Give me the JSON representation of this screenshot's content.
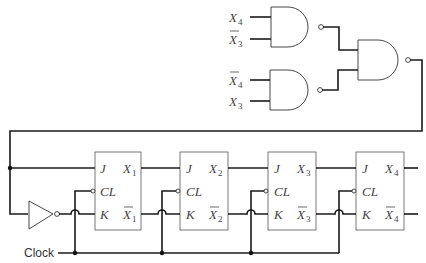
{
  "diagram": {
    "type": "logic-circuit",
    "gates": {
      "nand_top": {
        "inputs": [
          "X4",
          "X̄3"
        ],
        "input_labels": [
          {
            "base": "X",
            "sub": "4",
            "bar": false
          },
          {
            "base": "X",
            "sub": "3",
            "bar": true
          }
        ]
      },
      "nand_bottom": {
        "inputs": [
          "X̄4",
          "X3"
        ],
        "input_labels": [
          {
            "base": "X",
            "sub": "4",
            "bar": true
          },
          {
            "base": "X",
            "sub": "3",
            "bar": false
          }
        ]
      },
      "nand_output": {
        "inputs": [
          "nand_top",
          "nand_bottom"
        ]
      },
      "inverter": {
        "input": "feedback",
        "output": "FF1.K"
      }
    },
    "flip_flops": [
      {
        "id": "FF1",
        "pins": {
          "j": "J",
          "cl": "CL",
          "k": "K"
        },
        "q": "X",
        "q_sub": "1",
        "qbar_sub": "1"
      },
      {
        "id": "FF2",
        "pins": {
          "j": "J",
          "cl": "CL",
          "k": "K"
        },
        "q": "X",
        "q_sub": "2",
        "qbar_sub": "2"
      },
      {
        "id": "FF3",
        "pins": {
          "j": "J",
          "cl": "CL",
          "k": "K"
        },
        "q": "X",
        "q_sub": "3",
        "qbar_sub": "3"
      },
      {
        "id": "FF4",
        "pins": {
          "j": "J",
          "cl": "CL",
          "k": "K"
        },
        "q": "X",
        "q_sub": "4",
        "qbar_sub": "4"
      }
    ],
    "clock_label": "Clock"
  }
}
